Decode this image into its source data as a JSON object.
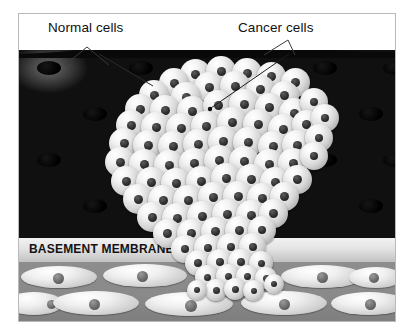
{
  "figure": {
    "kind": "medical-illustration"
  },
  "labels": {
    "normal_cells": "Normal cells",
    "cancer_cells": "Cancer cells",
    "basement_membrane": "BASEMENT MEMBRANE"
  },
  "colors": {
    "page_background": "#ffffff",
    "frame_border": "#b9b9b9",
    "label_text": "#111111",
    "epithelium_dark": "#080808",
    "epithelium_cell_highlight": "#6d6d6d",
    "epithelium_nucleus": "#000000",
    "basement_membrane_band": "#e3e3e3",
    "basement_membrane_text": "#141414",
    "stroma_background": "#8a8a8a",
    "stroma_cell": "#f0f0f0",
    "stroma_nucleus": "#6b6b6b",
    "tumor_cell": "#f3f3f3",
    "tumor_cell_shadow": "#7f7f7f",
    "tumor_nucleus": "#2e2e2e",
    "leader_line": "#3a3a3a"
  },
  "regions": [
    {
      "name": "epithelium",
      "label": "Normal cells",
      "description": "Dark ordered layer of uniform epithelial cells in a regular grid, each with one dark oval nucleus"
    },
    {
      "name": "tumor-mass",
      "label": "Cancer cells",
      "description": "Dense disordered cluster of pale rounded cells with dark nuclei, bulging the surface upward and breaking through the basement membrane"
    },
    {
      "name": "basement-membrane",
      "label": "BASEMENT MEMBRANE",
      "description": "Pale horizontal band separating epithelium from stroma, interrupted where the tumor invades"
    },
    {
      "name": "stroma",
      "label": "",
      "description": "Mid-gray connective tissue with elongated spindle-shaped fibroblasts, each with a round nucleus"
    }
  ],
  "epithelium_nuclei": [
    {
      "x": 18,
      "y": 15
    },
    {
      "x": 110,
      "y": 15
    },
    {
      "x": 202,
      "y": 15
    },
    {
      "x": 294,
      "y": 15
    },
    {
      "x": 364,
      "y": 15
    },
    {
      "x": 64,
      "y": 61
    },
    {
      "x": 156,
      "y": 61
    },
    {
      "x": 248,
      "y": 61
    },
    {
      "x": 340,
      "y": 61
    },
    {
      "x": 18,
      "y": 107
    },
    {
      "x": 110,
      "y": 107
    },
    {
      "x": 202,
      "y": 107
    },
    {
      "x": 294,
      "y": 107
    },
    {
      "x": 364,
      "y": 107
    },
    {
      "x": 64,
      "y": 153
    },
    {
      "x": 156,
      "y": 153
    },
    {
      "x": 248,
      "y": 153
    },
    {
      "x": 340,
      "y": 153
    }
  ],
  "stroma_cells": [
    {
      "x": 2,
      "y": 4,
      "w": 76,
      "h": 22,
      "nx": 32,
      "ny": 7,
      "nd": 11
    },
    {
      "x": 84,
      "y": 2,
      "w": 84,
      "h": 23,
      "nx": 34,
      "ny": 7,
      "nd": 11
    },
    {
      "x": 176,
      "y": 4,
      "w": 80,
      "h": 22,
      "nx": 34,
      "ny": 7,
      "nd": 10
    },
    {
      "x": 262,
      "y": 3,
      "w": 82,
      "h": 23,
      "nx": 36,
      "ny": 7,
      "nd": 11
    },
    {
      "x": 330,
      "y": 5,
      "w": 54,
      "h": 21,
      "nx": 20,
      "ny": 6,
      "nd": 10
    },
    {
      "x": -14,
      "y": 30,
      "w": 58,
      "h": 23,
      "nx": 42,
      "ny": 8,
      "nd": 9
    },
    {
      "x": 34,
      "y": 29,
      "w": 86,
      "h": 24,
      "nx": 36,
      "ny": 8,
      "nd": 11
    },
    {
      "x": 126,
      "y": 30,
      "w": 88,
      "h": 24,
      "nx": 40,
      "ny": 8,
      "nd": 12
    },
    {
      "x": 222,
      "y": 29,
      "w": 86,
      "h": 24,
      "nx": 38,
      "ny": 8,
      "nd": 11
    },
    {
      "x": 312,
      "y": 30,
      "w": 76,
      "h": 23,
      "nx": 34,
      "ny": 7,
      "nd": 11
    }
  ],
  "tumor_cells": [
    {
      "x": 161,
      "y": 13,
      "d": 31
    },
    {
      "x": 187,
      "y": 10,
      "d": 30
    },
    {
      "x": 213,
      "y": 12,
      "d": 30
    },
    {
      "x": 238,
      "y": 16,
      "d": 29
    },
    {
      "x": 140,
      "y": 22,
      "d": 30
    },
    {
      "x": 262,
      "y": 22,
      "d": 29
    },
    {
      "x": 120,
      "y": 34,
      "d": 30
    },
    {
      "x": 175,
      "y": 26,
      "d": 30
    },
    {
      "x": 201,
      "y": 25,
      "d": 30
    },
    {
      "x": 227,
      "y": 29,
      "d": 29
    },
    {
      "x": 251,
      "y": 35,
      "d": 29
    },
    {
      "x": 152,
      "y": 36,
      "d": 30
    },
    {
      "x": 106,
      "y": 48,
      "d": 30
    },
    {
      "x": 131,
      "y": 49,
      "d": 30
    },
    {
      "x": 158,
      "y": 50,
      "d": 30
    },
    {
      "x": 184,
      "y": 44,
      "d": 30
    },
    {
      "x": 210,
      "y": 43,
      "d": 30
    },
    {
      "x": 236,
      "y": 47,
      "d": 29
    },
    {
      "x": 260,
      "y": 52,
      "d": 30
    },
    {
      "x": 281,
      "y": 42,
      "d": 28
    },
    {
      "x": 97,
      "y": 64,
      "d": 30
    },
    {
      "x": 122,
      "y": 66,
      "d": 30
    },
    {
      "x": 147,
      "y": 67,
      "d": 30
    },
    {
      "x": 172,
      "y": 65,
      "d": 30
    },
    {
      "x": 198,
      "y": 61,
      "d": 30
    },
    {
      "x": 224,
      "y": 63,
      "d": 30
    },
    {
      "x": 249,
      "y": 68,
      "d": 30
    },
    {
      "x": 273,
      "y": 64,
      "d": 29
    },
    {
      "x": 292,
      "y": 58,
      "d": 28
    },
    {
      "x": 90,
      "y": 82,
      "d": 30
    },
    {
      "x": 114,
      "y": 84,
      "d": 30
    },
    {
      "x": 139,
      "y": 85,
      "d": 30
    },
    {
      "x": 164,
      "y": 83,
      "d": 30
    },
    {
      "x": 189,
      "y": 80,
      "d": 30
    },
    {
      "x": 214,
      "y": 81,
      "d": 30
    },
    {
      "x": 239,
      "y": 85,
      "d": 30
    },
    {
      "x": 263,
      "y": 84,
      "d": 30
    },
    {
      "x": 286,
      "y": 78,
      "d": 28
    },
    {
      "x": 86,
      "y": 101,
      "d": 30
    },
    {
      "x": 110,
      "y": 103,
      "d": 30
    },
    {
      "x": 135,
      "y": 104,
      "d": 30
    },
    {
      "x": 160,
      "y": 102,
      "d": 30
    },
    {
      "x": 185,
      "y": 99,
      "d": 30
    },
    {
      "x": 210,
      "y": 100,
      "d": 30
    },
    {
      "x": 235,
      "y": 103,
      "d": 30
    },
    {
      "x": 259,
      "y": 102,
      "d": 30
    },
    {
      "x": 281,
      "y": 96,
      "d": 28
    },
    {
      "x": 92,
      "y": 120,
      "d": 30
    },
    {
      "x": 117,
      "y": 121,
      "d": 30
    },
    {
      "x": 142,
      "y": 122,
      "d": 30
    },
    {
      "x": 167,
      "y": 120,
      "d": 30
    },
    {
      "x": 192,
      "y": 117,
      "d": 30
    },
    {
      "x": 217,
      "y": 118,
      "d": 30
    },
    {
      "x": 241,
      "y": 121,
      "d": 30
    },
    {
      "x": 264,
      "y": 119,
      "d": 29
    },
    {
      "x": 104,
      "y": 138,
      "d": 30
    },
    {
      "x": 129,
      "y": 139,
      "d": 30
    },
    {
      "x": 154,
      "y": 139,
      "d": 30
    },
    {
      "x": 179,
      "y": 136,
      "d": 30
    },
    {
      "x": 204,
      "y": 135,
      "d": 30
    },
    {
      "x": 228,
      "y": 137,
      "d": 30
    },
    {
      "x": 251,
      "y": 136,
      "d": 29
    },
    {
      "x": 118,
      "y": 156,
      "d": 30
    },
    {
      "x": 143,
      "y": 157,
      "d": 30
    },
    {
      "x": 168,
      "y": 155,
      "d": 30
    },
    {
      "x": 193,
      "y": 153,
      "d": 30
    },
    {
      "x": 217,
      "y": 154,
      "d": 30
    },
    {
      "x": 240,
      "y": 153,
      "d": 29
    },
    {
      "x": 134,
      "y": 173,
      "d": 29
    },
    {
      "x": 158,
      "y": 173,
      "d": 29
    },
    {
      "x": 182,
      "y": 171,
      "d": 29
    },
    {
      "x": 206,
      "y": 170,
      "d": 29
    },
    {
      "x": 229,
      "y": 170,
      "d": 28
    },
    {
      "x": 152,
      "y": 189,
      "d": 28
    },
    {
      "x": 175,
      "y": 188,
      "d": 28
    },
    {
      "x": 198,
      "y": 187,
      "d": 28
    },
    {
      "x": 220,
      "y": 187,
      "d": 27
    },
    {
      "x": 166,
      "y": 204,
      "d": 26
    },
    {
      "x": 188,
      "y": 203,
      "d": 26
    },
    {
      "x": 209,
      "y": 203,
      "d": 25
    },
    {
      "x": 230,
      "y": 205,
      "d": 24
    },
    {
      "x": 176,
      "y": 219,
      "d": 24
    },
    {
      "x": 197,
      "y": 218,
      "d": 24
    },
    {
      "x": 217,
      "y": 219,
      "d": 23
    },
    {
      "x": 236,
      "y": 221,
      "d": 22
    },
    {
      "x": 186,
      "y": 233,
      "d": 22
    },
    {
      "x": 205,
      "y": 232,
      "d": 22
    },
    {
      "x": 224,
      "y": 234,
      "d": 21
    },
    {
      "x": 245,
      "y": 228,
      "d": 20
    },
    {
      "x": 168,
      "y": 234,
      "d": 20
    }
  ]
}
